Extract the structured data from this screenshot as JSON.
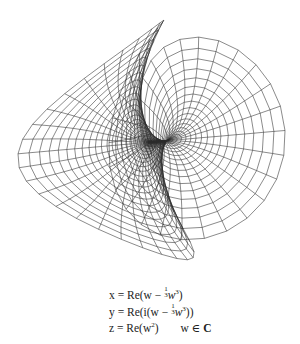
{
  "figure": {
    "chart_data": {
      "type": "surface-wireframe",
      "parametrization": {
        "x": "Re(w - (1/3) w^3)",
        "y": "Re(i (w - (1/3) w^3))",
        "z": "Re(w^2)",
        "domain": "w ∈ C"
      }
    },
    "formulas": {
      "x_lhs": "x = Re(w − ",
      "x_frac_num": "1",
      "x_frac_den": "3",
      "x_rhs": "w",
      "x_pow": "3",
      "x_close": ")",
      "y_lhs": "y = Re(i(w − ",
      "y_frac_num": "1",
      "y_frac_den": "3",
      "y_rhs": "w",
      "y_pow": "3",
      "y_close": "))",
      "z_lhs": "z = Re(w",
      "z_pow": "2",
      "z_close": ")",
      "domain_w": "w ∈ ",
      "domain_set": "C"
    }
  }
}
